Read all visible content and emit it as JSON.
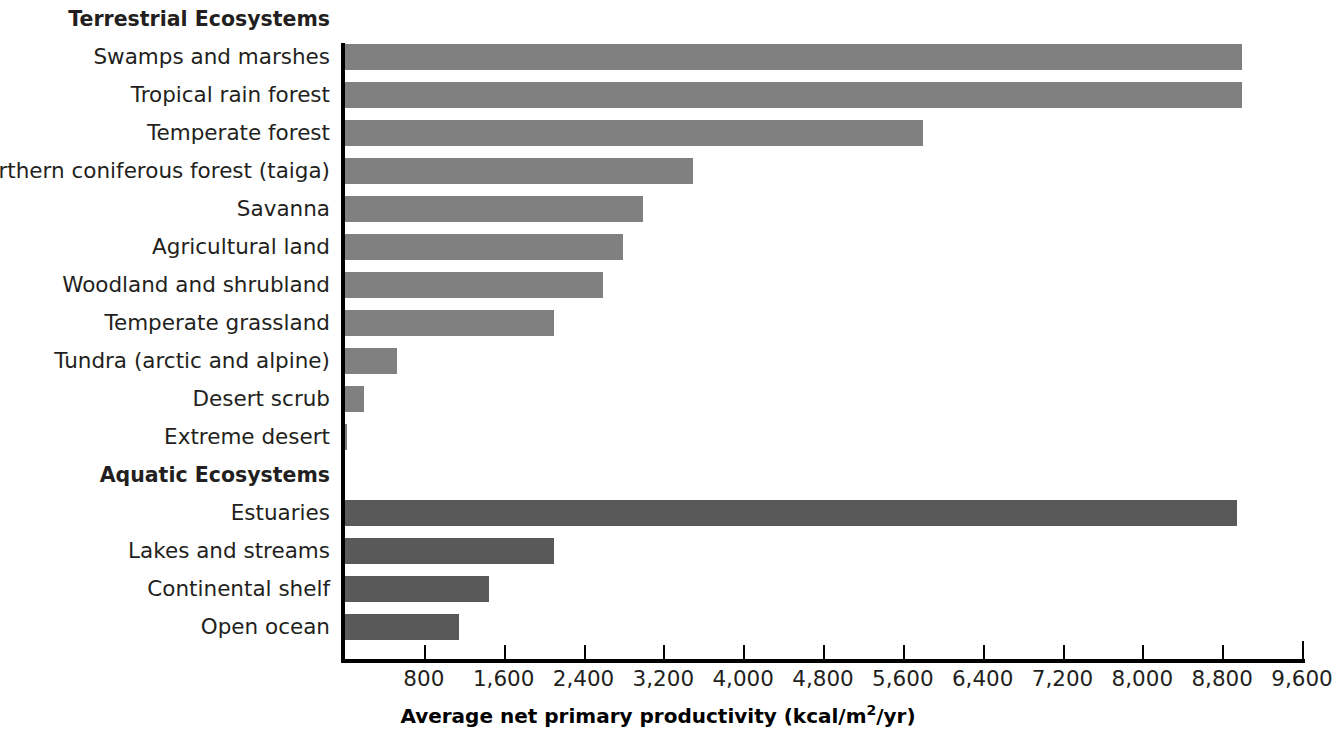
{
  "chart_data": {
    "type": "bar",
    "orientation": "horizontal",
    "title": "",
    "xlabel": "Average net primary productivity (kcal/m2/yr)",
    "xlabel_parts": {
      "before": "Average net primary productivity (kcal/m",
      "sup": "2",
      "after": "/yr)"
    },
    "ylabel": "",
    "xlim": [
      0,
      9600
    ],
    "xticks": [
      800,
      1600,
      2400,
      3200,
      4000,
      4800,
      5600,
      6400,
      7200,
      8000,
      8800,
      9600
    ],
    "xticklabels": [
      "800",
      "1,600",
      "2,400",
      "3,200",
      "4,000",
      "4,800",
      "5,600",
      "6,400",
      "7,200",
      "8,000",
      "8,800",
      "9,600"
    ],
    "grid": false,
    "legend": "none",
    "groups": [
      {
        "label": "Terrestrial Ecosystems",
        "color": "#808080"
      },
      {
        "label": "Aquatic Ecosystems",
        "color": "#595959"
      }
    ],
    "categories": [
      "Swamps and marshes",
      "Tropical rain forest",
      "Temperate forest",
      "Northern coniferous forest (taiga)",
      "Savanna",
      "Agricultural land",
      "Woodland and shrubland",
      "Temperate grassland",
      "Tundra (arctic and alpine)",
      "Desert scrub",
      "Extreme desert",
      "Estuaries",
      "Lakes and streams",
      "Continental shelf",
      "Open ocean"
    ],
    "values": [
      9000,
      9000,
      5800,
      3500,
      3000,
      2800,
      2600,
      2100,
      530,
      200,
      30,
      8950,
      2100,
      1450,
      1150
    ]
  },
  "rows": [
    {
      "label": "Terrestrial Ecosystems",
      "type": "group"
    },
    {
      "label": "Swamps and marshes",
      "type": "bar",
      "group": "terrestrial",
      "value": 9000
    },
    {
      "label": "Tropical rain forest",
      "type": "bar",
      "group": "terrestrial",
      "value": 9000
    },
    {
      "label": "Temperate forest",
      "type": "bar",
      "group": "terrestrial",
      "value": 5800
    },
    {
      "label": "Northern coniferous forest (taiga)",
      "type": "bar",
      "group": "terrestrial",
      "value": 3500
    },
    {
      "label": "Savanna",
      "type": "bar",
      "group": "terrestrial",
      "value": 3000
    },
    {
      "label": "Agricultural land",
      "type": "bar",
      "group": "terrestrial",
      "value": 2800
    },
    {
      "label": "Woodland and shrubland",
      "type": "bar",
      "group": "terrestrial",
      "value": 2600
    },
    {
      "label": "Temperate grassland",
      "type": "bar",
      "group": "terrestrial",
      "value": 2100
    },
    {
      "label": "Tundra (arctic and alpine)",
      "type": "bar",
      "group": "terrestrial",
      "value": 530
    },
    {
      "label": "Desert scrub",
      "type": "bar",
      "group": "terrestrial",
      "value": 200
    },
    {
      "label": "Extreme desert",
      "type": "bar",
      "group": "terrestrial",
      "value": 30
    },
    {
      "label": "Aquatic Ecosystems",
      "type": "group"
    },
    {
      "label": "Estuaries",
      "type": "bar",
      "group": "aquatic",
      "value": 8950
    },
    {
      "label": "Lakes and streams",
      "type": "bar",
      "group": "aquatic",
      "value": 2100
    },
    {
      "label": "Continental shelf",
      "type": "bar",
      "group": "aquatic",
      "value": 1450
    },
    {
      "label": "Open ocean",
      "type": "bar",
      "group": "aquatic",
      "value": 1150
    }
  ],
  "colors": {
    "terrestrial_bar": "#808080",
    "aquatic_bar": "#595959",
    "axis": "#000000",
    "text": "#231f20",
    "background": "#ffffff"
  }
}
